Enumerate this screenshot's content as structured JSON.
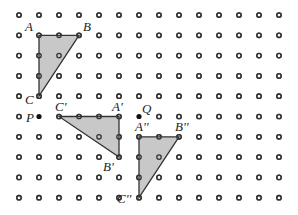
{
  "grid": {
    "cols": 14,
    "rows": 10,
    "origin_x": 19,
    "origin_y": 15,
    "spacing_x": 20,
    "spacing_y": 20.3,
    "dot_color": "#333333",
    "dot_fill": "#ffffff"
  },
  "colors": {
    "triangle_fill": "#c8c8c8",
    "triangle_stroke": "#333333",
    "point_fill": "#111111"
  },
  "triangles": [
    {
      "name": "ABC",
      "vertices": [
        {
          "label": "A",
          "col": 1,
          "row": 1,
          "dx": -14,
          "dy": -4
        },
        {
          "label": "B",
          "col": 3,
          "row": 1,
          "dx": 4,
          "dy": -4
        },
        {
          "label": "C",
          "col": 1,
          "row": 4,
          "dx": -14,
          "dy": 8
        }
      ]
    },
    {
      "name": "A'B'C'",
      "vertices": [
        {
          "label": "A'",
          "col": 5,
          "row": 5,
          "dx": -7,
          "dy": -6
        },
        {
          "label": "B'",
          "col": 5,
          "row": 7,
          "dx": -16,
          "dy": 14
        },
        {
          "label": "C'",
          "col": 2,
          "row": 5,
          "dx": -4,
          "dy": -6
        }
      ]
    },
    {
      "name": "A''B''C''",
      "vertices": [
        {
          "label": "A''",
          "col": 6,
          "row": 6,
          "dx": -4,
          "dy": -6
        },
        {
          "label": "B''",
          "col": 8,
          "row": 6,
          "dx": -4,
          "dy": -6
        },
        {
          "label": "C''",
          "col": 6,
          "row": 9,
          "dx": -22,
          "dy": 5
        }
      ]
    }
  ],
  "points": [
    {
      "label": "P",
      "col": 1,
      "row": 5,
      "dx": -13,
      "dy": 5
    },
    {
      "label": "Q",
      "col": 6,
      "row": 5,
      "dx": 3,
      "dy": -4
    }
  ]
}
